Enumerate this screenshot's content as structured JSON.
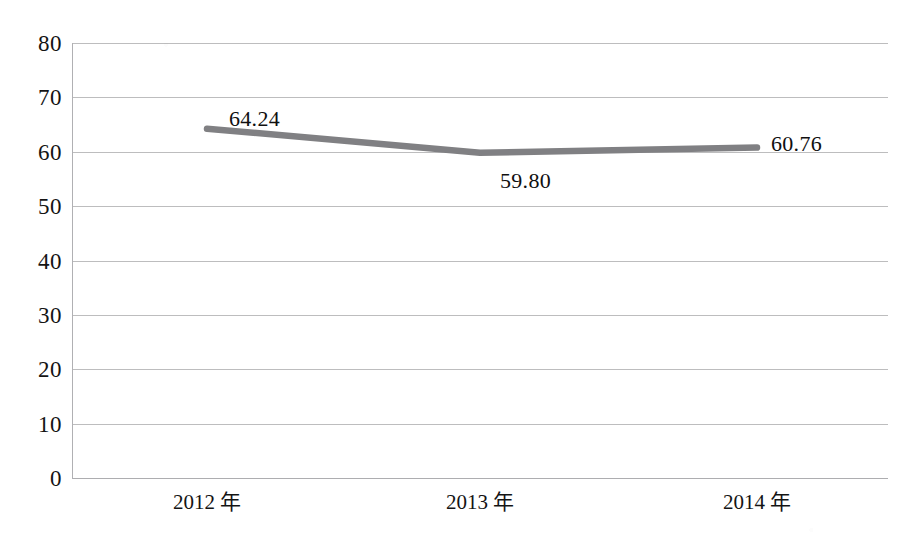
{
  "chart_data": {
    "type": "line",
    "title": "",
    "subtitle": "",
    "xlabel": "",
    "ylabel": "",
    "categories": [
      "2012 年",
      "2013 年",
      "2014 年"
    ],
    "series": [
      {
        "name": "",
        "values": [
          64.24,
          59.8,
          60.76
        ]
      }
    ],
    "point_labels": [
      "64.24",
      "59.80",
      "60.76"
    ],
    "ylim": [
      0,
      80
    ],
    "ytick_step": 10,
    "ytick_labels": [
      "80",
      "70",
      "60",
      "50",
      "40",
      "30",
      "20",
      "10",
      "0"
    ],
    "ytick_values": [
      80,
      70,
      60,
      50,
      40,
      30,
      20,
      10,
      0
    ],
    "grid": true,
    "grid_axis": "y",
    "legend": false,
    "legend_position": "none",
    "markers": false,
    "colors": {
      "series_line": "#808083",
      "gridline": "#b9b9bb",
      "axis": "#a9a9ac",
      "text": "#141414",
      "background": "#ffffff"
    }
  },
  "axes": {
    "y": {
      "ticks": [
        {
          "label": "80",
          "value": 80
        },
        {
          "label": "70",
          "value": 70
        },
        {
          "label": "60",
          "value": 60
        },
        {
          "label": "50",
          "value": 50
        },
        {
          "label": "40",
          "value": 40
        },
        {
          "label": "30",
          "value": 30
        },
        {
          "label": "20",
          "value": 20
        },
        {
          "label": "10",
          "value": 10
        },
        {
          "label": "0",
          "value": 0
        }
      ]
    },
    "x": {
      "ticks": [
        {
          "label": "2012 年"
        },
        {
          "label": "2013 年"
        },
        {
          "label": "2014 年"
        }
      ]
    }
  },
  "labels": {
    "point_0": "64.24",
    "point_1": "59.80",
    "point_2": "60.76"
  }
}
